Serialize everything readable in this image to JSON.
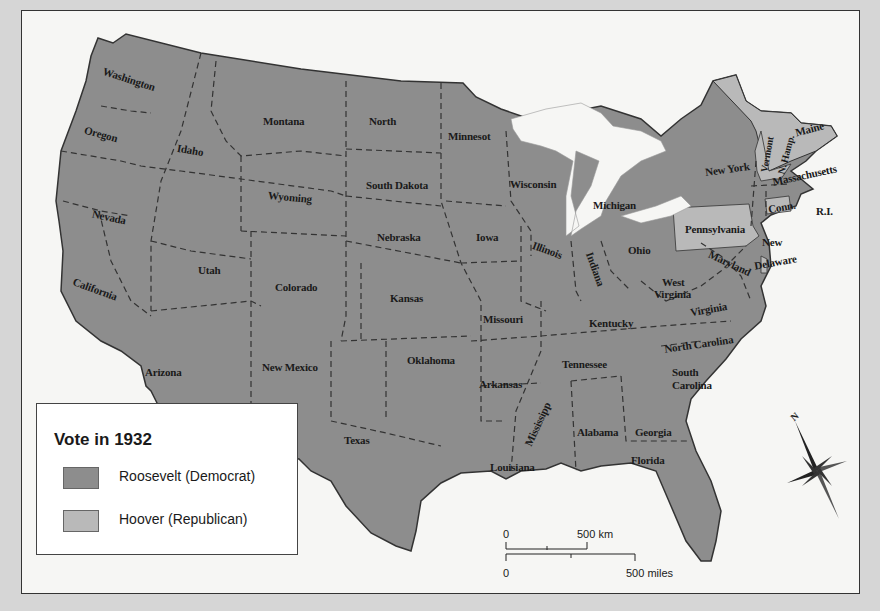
{
  "map": {
    "title": "Vote in 1932",
    "legend": [
      {
        "label": "Roosevelt (Democrat)",
        "color": "#8d8d8d"
      },
      {
        "label": "Hoover (Republican)",
        "color": "#b9b9b9"
      }
    ],
    "colors": {
      "democrat": "#8d8d8d",
      "republican": "#b9b9b9",
      "background": "#f6f6f4",
      "outer": "#d6d6d6"
    },
    "states": {
      "washington": "Washington",
      "oregon": "Oregon",
      "idaho": "Idaho",
      "montana": "Montana",
      "north_dakota": "North",
      "minnesota": "Minnesot",
      "wisconsin": "Wisconsin",
      "michigan": "Michigan",
      "south_dakota": "South Dakota",
      "wyoming": "Wyoming",
      "nevada": "Nevada",
      "california": "California",
      "utah": "Utah",
      "colorado": "Colorado",
      "nebraska": "Nebraska",
      "iowa": "Iowa",
      "illinois": "Illinois",
      "indiana": "Indiana",
      "ohio": "Ohio",
      "kansas": "Kansas",
      "missouri": "Missouri",
      "kentucky": "Kentucky",
      "west_virginia_1": "West",
      "west_virginia_2": "Virginia",
      "virginia": "Virginia",
      "arizona": "Arizona",
      "new_mexico": "New Mexico",
      "oklahoma": "Oklahoma",
      "arkansas": "Arkansas",
      "tennessee": "Tennessee",
      "north_carolina": "North Carolina",
      "south_carolina_1": "South",
      "south_carolina_2": "Carolina",
      "texas": "Texas",
      "louisiana": "Louisiana",
      "mississippi": "Mississipp",
      "alabama": "Alabama",
      "georgia": "Georgia",
      "florida": "Florida",
      "new_york": "New York",
      "pennsylvania": "Pennsylvania",
      "new_jersey": "New",
      "maryland": "Maryland",
      "delaware": "Delaware",
      "maine": "Maine",
      "vermont": "Vermont",
      "new_hampshire": "N. Hamp.",
      "massachusetts": "Massachusetts",
      "connecticut": "Conn.",
      "rhode_island": "R.I."
    },
    "hoover_states": [
      "Maine",
      "Vermont",
      "New Hampshire",
      "Pennsylvania",
      "Connecticut",
      "Delaware"
    ],
    "scale": {
      "km_zero": "0",
      "km_label": "500 km",
      "mi_zero": "0",
      "mi_label": "500 miles"
    },
    "compass": {
      "label": "N"
    }
  }
}
